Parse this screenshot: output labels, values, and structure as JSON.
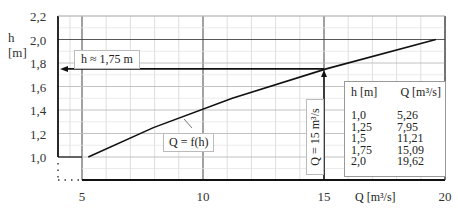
{
  "chart_data": {
    "type": "line",
    "title": "",
    "xlabel": "Q [m³/s]",
    "ylabel": "h [m]",
    "ylabel_line1": "h",
    "ylabel_line2": "[m]",
    "xlim": [
      5,
      20
    ],
    "ylim": [
      1.0,
      2.2
    ],
    "x_ticks": [
      "5",
      "10",
      "15",
      "20"
    ],
    "y_ticks": [
      "2,2",
      "2,0",
      "1,8",
      "1,6",
      "1,4",
      "1,2",
      "1,0"
    ],
    "grid": true,
    "series": [
      {
        "name": "Q = f(h)",
        "x": [
          5.26,
          7.95,
          11.21,
          15.09,
          19.62
        ],
        "y": [
          1.0,
          1.25,
          1.5,
          1.75,
          2.0
        ]
      }
    ],
    "annotations": {
      "h_readout": "h ≈ 1,75 m",
      "q_readout": "Q = 15 m³/s",
      "curve_label": "Q = f(h)",
      "readout_point": {
        "Q": 15,
        "h": 1.75
      }
    },
    "table": {
      "headers": [
        "h [m]",
        "Q [m³/s]"
      ],
      "rows": [
        [
          "1,0",
          "5,26"
        ],
        [
          "1,25",
          "7,95"
        ],
        [
          "1,5",
          "11,21"
        ],
        [
          "1,75",
          "15,09"
        ],
        [
          "2,0",
          "19,62"
        ]
      ]
    }
  }
}
